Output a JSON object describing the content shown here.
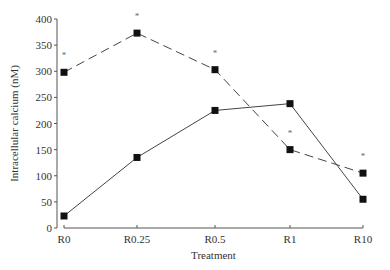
{
  "chart_data": {
    "type": "line",
    "title": "",
    "xlabel": "Treatment",
    "ylabel": "Intracellular calcium (nM)",
    "ylim": [
      0,
      400
    ],
    "yticks": [
      0,
      50,
      100,
      150,
      200,
      250,
      300,
      350,
      400
    ],
    "categories": [
      "R0",
      "R0.25",
      "R0.5",
      "R1",
      "R10"
    ],
    "grid": false,
    "legend": null,
    "series": [
      {
        "name": "dashed",
        "style": "dashed",
        "marker": "square",
        "values": [
          298,
          373,
          303,
          150,
          105
        ],
        "significance": [
          "*",
          "*",
          "*",
          "*",
          "*"
        ]
      },
      {
        "name": "solid",
        "style": "solid",
        "marker": "square",
        "values": [
          23,
          135,
          225,
          238,
          55
        ]
      }
    ]
  }
}
